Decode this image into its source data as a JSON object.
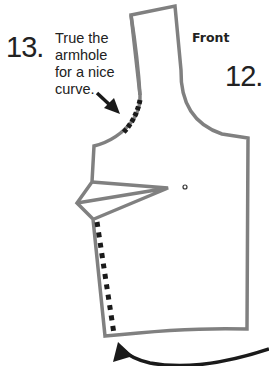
{
  "diagram": {
    "label": "Front",
    "steps": [
      {
        "number": "13.",
        "instruction_lines": [
          "True the",
          "armhole",
          "for a nice",
          "curve."
        ]
      },
      {
        "number": "12."
      }
    ],
    "colors": {
      "pattern_outline": "#808080",
      "dotted_marks": "#1a1a1a",
      "arrows": "#1a1a1a",
      "text": "#222222"
    }
  }
}
